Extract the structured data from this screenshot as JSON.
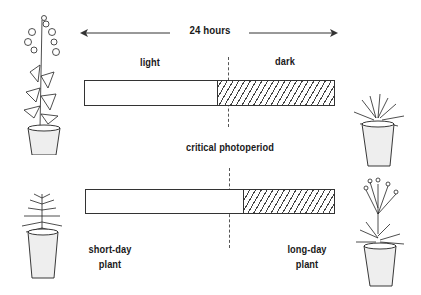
{
  "duration": {
    "label": "24 hours"
  },
  "top_bar": {
    "light_label": "light",
    "dark_label": "dark",
    "light_fraction": 0.53,
    "dark_fraction": 0.47
  },
  "critical": {
    "label": "critical photoperiod",
    "position_fraction": 0.57
  },
  "bottom_bar": {
    "light_fraction": 0.63,
    "dark_fraction": 0.37
  },
  "plants": {
    "short_day": {
      "label_line1": "short-day",
      "label_line2": "plant"
    },
    "long_day": {
      "label_line1": "long-day",
      "label_line2": "plant"
    }
  },
  "colors": {
    "ink": "#1a1a1a",
    "background": "#ffffff"
  }
}
